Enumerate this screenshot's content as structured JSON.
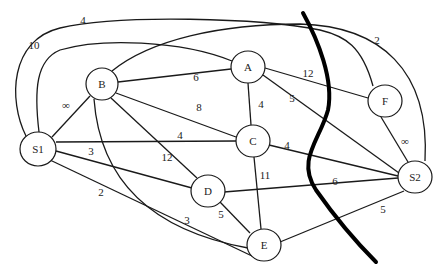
{
  "title": "",
  "nodes": [
    {
      "id": "S1",
      "label": "S1"
    },
    {
      "id": "B",
      "label": "B"
    },
    {
      "id": "A",
      "label": "A"
    },
    {
      "id": "F",
      "label": "F"
    },
    {
      "id": "C",
      "label": "C"
    },
    {
      "id": "D",
      "label": "D"
    },
    {
      "id": "E",
      "label": "E"
    },
    {
      "id": "S2",
      "label": "S2"
    }
  ],
  "edges": [
    {
      "from": "S1",
      "to": "F",
      "weight": "4"
    },
    {
      "from": "S1",
      "to": "A",
      "weight": "10"
    },
    {
      "from": "B",
      "to": "S2",
      "weight": "2"
    },
    {
      "from": "S1",
      "to": "B",
      "weight": "∞"
    },
    {
      "from": "B",
      "to": "A",
      "weight": "6"
    },
    {
      "from": "B",
      "to": "C",
      "weight": "8"
    },
    {
      "from": "B",
      "to": "D",
      "weight": "12"
    },
    {
      "from": "B",
      "to": "E",
      "weight": "3"
    },
    {
      "from": "S1",
      "to": "C",
      "weight": "4"
    },
    {
      "from": "S1",
      "to": "D",
      "weight": "3"
    },
    {
      "from": "S1",
      "to": "E",
      "weight": "2"
    },
    {
      "from": "A",
      "to": "C",
      "weight": "4"
    },
    {
      "from": "A",
      "to": "F",
      "weight": "12"
    },
    {
      "from": "A",
      "to": "S2",
      "weight": "5"
    },
    {
      "from": "F",
      "to": "S2",
      "weight": "∞"
    },
    {
      "from": "C",
      "to": "S2",
      "weight": "4"
    },
    {
      "from": "C",
      "to": "E",
      "weight": "11"
    },
    {
      "from": "D",
      "to": "S2",
      "weight": "6"
    },
    {
      "from": "D",
      "to": "E",
      "weight": "5"
    },
    {
      "from": "E",
      "to": "S2",
      "weight": "5"
    }
  ],
  "cut": {
    "label": "cut-line",
    "color": "#000000"
  }
}
